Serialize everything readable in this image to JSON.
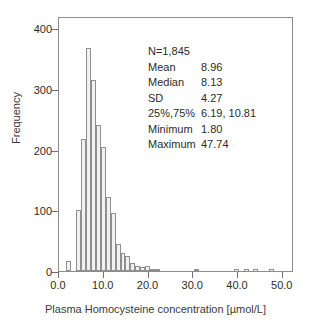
{
  "chart_data": {
    "type": "bar",
    "title": "",
    "subtitle": "",
    "xlabel": "Plasma Homocysteine concentration [µmol/L]",
    "ylabel": "Frequency",
    "xlim": [
      0,
      52.5
    ],
    "ylim": [
      0,
      420
    ],
    "xticks": [
      0.0,
      10.0,
      20.0,
      30.0,
      40.0,
      50.0
    ],
    "xticklabels": [
      "0.0",
      "10.0",
      "20.0",
      "30.0",
      "40.0",
      "50.0"
    ],
    "yticks": [
      0,
      100,
      200,
      300,
      400
    ],
    "yticklabels": [
      "0",
      "100",
      "200",
      "300",
      "400"
    ],
    "grid": false,
    "legend": null,
    "bin_width": 1.1,
    "bar_fill": "#f1f1f1",
    "bar_edge": "#8f8f8f",
    "bins_left": [
      1.65,
      2.75,
      3.85,
      4.95,
      6.05,
      7.15,
      8.25,
      9.35,
      10.45,
      11.55,
      12.65,
      13.75,
      14.85,
      15.95,
      17.05,
      18.15,
      19.25,
      20.35,
      21.45,
      22.55,
      23.65,
      24.75,
      25.85,
      30.25,
      39.05,
      41.25,
      43.45,
      47.0
    ],
    "values": [
      17,
      0,
      101,
      218,
      368,
      314,
      241,
      205,
      122,
      95,
      44,
      30,
      25,
      14,
      8,
      7,
      9,
      4,
      4,
      0,
      0,
      0,
      0,
      4,
      1,
      1,
      1,
      1
    ],
    "categories": [
      "1.65",
      "2.75",
      "3.85",
      "4.95",
      "6.05",
      "7.15",
      "8.25",
      "9.35",
      "10.45",
      "11.55",
      "12.65",
      "13.75",
      "14.85",
      "15.95",
      "17.05",
      "18.15",
      "19.25",
      "20.35",
      "21.45",
      "22.55",
      "23.65",
      "24.75",
      "25.85",
      "30.25",
      "39.05",
      "41.25",
      "43.45",
      "47.0"
    ]
  },
  "stats": {
    "n": "N=1,845",
    "mean_label": "Mean",
    "mean_value": "8.96",
    "median_label": "Median",
    "median_value": "8.13",
    "sd_label": "SD",
    "sd_value": "4.27",
    "quartile_label": "25%,75%",
    "quartile_value": "6.19, 10.81",
    "minimum_label": "Minimum",
    "minimum_value": "1.80",
    "maximum_label": "Maximum",
    "maximum_value": "47.74"
  }
}
